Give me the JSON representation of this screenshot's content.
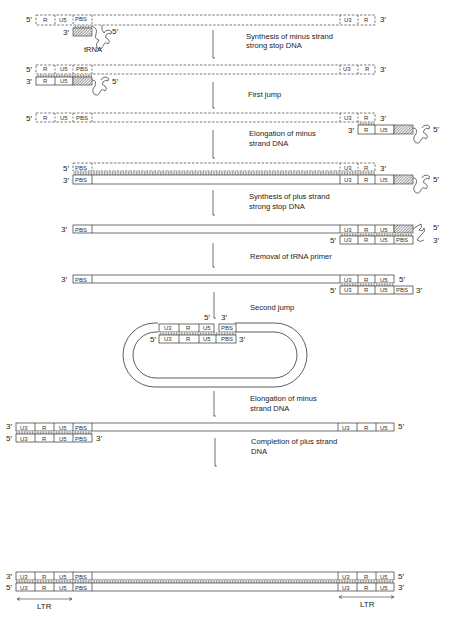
{
  "diagram": {
    "steps": [
      {
        "label_line1": "Synthesis of minus strand",
        "label_line2": "strong stop DNA"
      },
      {
        "label_line1": "First jump",
        "label_line2": ""
      },
      {
        "label_line1": "Elongation of minus",
        "label_line2": "strand DNA"
      },
      {
        "label_line1": "Synthesis of plus strand",
        "label_line2": "strong stop DNA"
      },
      {
        "label_line1": "Removal of tRNA primer",
        "label_line2": ""
      },
      {
        "label_line1": "Second jump",
        "label_line2": ""
      },
      {
        "label_line1": "Elongation of minus",
        "label_line2": "strand DNA"
      },
      {
        "label_line1": "Completion of plus strand",
        "label_line2": "DNA"
      }
    ],
    "regions": {
      "r": "R",
      "u5": "U5",
      "u3": "U3",
      "pbs": "PBS"
    },
    "ends": {
      "five": "5′",
      "three": "3′"
    },
    "trna_label": "tRNA",
    "ltr_label": "LTR"
  }
}
